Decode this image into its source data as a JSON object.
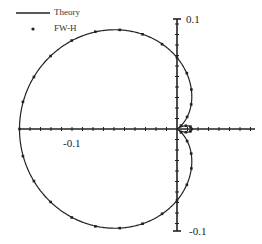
{
  "chart_data": {
    "type": "scatter",
    "subtype": "polar-directivity",
    "title": "",
    "legend": [
      {
        "label": "Theory",
        "style": "line"
      },
      {
        "label": "FW-H",
        "style": "dot"
      }
    ],
    "legend_position": "top-left",
    "axes": {
      "x_tick_labels": [
        "-0.1"
      ],
      "y_tick_labels": [
        "0.1",
        "-0.1"
      ],
      "x_range": [
        -0.15,
        0.1
      ],
      "y_range": [
        -0.1,
        0.1
      ]
    },
    "model": {
      "form": "r = |a - b*cos(theta)|",
      "a": 0.068,
      "b": 0.082
    },
    "series": [
      {
        "name": "FW-H",
        "angle_deg": [
          0,
          10,
          20,
          40,
          50,
          60,
          70,
          80,
          90,
          100,
          110,
          120,
          130,
          140,
          150,
          160,
          170,
          180,
          190,
          200,
          210,
          220,
          230,
          240,
          250,
          260,
          270,
          280,
          290,
          300,
          310,
          320,
          340,
          350
        ],
        "r": [
          0.014,
          0.013,
          0.009,
          0.005,
          0.015,
          0.027,
          0.04,
          0.054,
          0.068,
          0.082,
          0.096,
          0.109,
          0.121,
          0.131,
          0.139,
          0.145,
          0.149,
          0.15,
          0.149,
          0.145,
          0.139,
          0.131,
          0.121,
          0.109,
          0.096,
          0.082,
          0.068,
          0.054,
          0.04,
          0.027,
          0.015,
          0.005,
          0.009,
          0.013
        ]
      }
    ]
  },
  "legend": {
    "theory": "Theory",
    "fwh": "FW-H"
  },
  "ticks": {
    "y_top": "0.1",
    "y_bottom": "-0.1",
    "x_left": "-0.1"
  },
  "colors": {
    "line": "#222222",
    "dot": "#222222",
    "axis": "#222222"
  }
}
